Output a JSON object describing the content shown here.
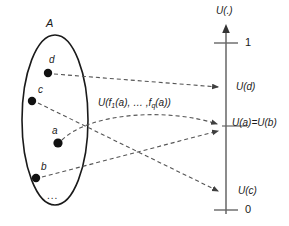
{
  "figure": {
    "set_label": "A",
    "ellipsis_label": "...",
    "elements": [
      {
        "name": "d",
        "x": 48,
        "y": 73,
        "label_x": 49,
        "label_y": 60
      },
      {
        "name": "c",
        "x": 32,
        "y": 101,
        "label_x": 38,
        "label_y": 90
      },
      {
        "name": "a",
        "x": 58,
        "y": 143,
        "label_x": 53,
        "label_y": 130
      },
      {
        "name": "b",
        "x": 36,
        "y": 178,
        "label_x": 41,
        "label_y": 166
      }
    ],
    "mapping_label": "U(f",
    "mapping_label_sub1": "1",
    "mapping_label_mid": "(a), … ,f",
    "mapping_label_sub2": "q",
    "mapping_label_end": "(a))",
    "axis": {
      "title": "U(.)",
      "top_tick": "1",
      "bottom_tick": "0",
      "values": [
        {
          "label": "U(d)",
          "y": 88
        },
        {
          "label": "U(a)=U(b)",
          "y": 126
        },
        {
          "label": "U(c)",
          "y": 192
        }
      ]
    },
    "colors": {
      "stroke": "#1a1a1a",
      "dashed": "#4d4d4d",
      "axis": "#555555",
      "background": "#ffffff"
    }
  }
}
